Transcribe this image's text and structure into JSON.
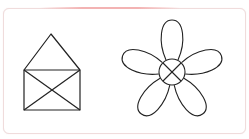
{
  "figure": {
    "frame": {
      "border_color": "#f0dcdc",
      "accent_color": "#f3b3b3"
    },
    "stroke_color": "#222222",
    "shapes": [
      {
        "name": "house",
        "roof": {
          "apex": [
            51,
            34
          ],
          "left": [
            24,
            70
          ],
          "right": [
            80,
            70
          ]
        },
        "body": {
          "x": 24,
          "y": 70,
          "width": 56,
          "height": 40
        },
        "diagonals": true
      },
      {
        "name": "flower",
        "center": [
          172,
          72
        ],
        "center_radius": 13,
        "center_cross": true,
        "petals": 5,
        "petal_length": 40,
        "petal_width": 22
      }
    ]
  }
}
